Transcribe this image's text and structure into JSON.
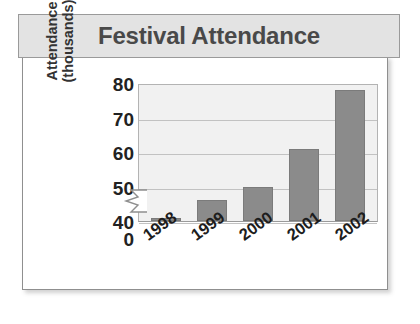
{
  "chart_data": {
    "type": "bar",
    "title": "Festival Attendance",
    "xlabel": "",
    "ylabel": "Attendance (thousands)",
    "ylabel_lines": [
      "Attendance",
      "(thousands)"
    ],
    "categories": [
      "1998",
      "1999",
      "2000",
      "2001",
      "2002"
    ],
    "values": [
      41,
      46,
      50,
      61,
      78
    ],
    "series": [
      {
        "name": "Attendance",
        "values": [
          41,
          46,
          50,
          61,
          78
        ]
      }
    ],
    "ytick_labels": [
      "80",
      "70",
      "60",
      "50",
      "40",
      "0"
    ],
    "ytick_values": [
      80,
      70,
      60,
      50,
      40,
      0
    ],
    "ylim": [
      40,
      80
    ],
    "axis_break": true,
    "axis_break_between": [
      0,
      40
    ],
    "grid": true,
    "grid_axis": "y",
    "legend": false,
    "legend_position": "none",
    "bar_color": "#8b8b8b",
    "plot_background": "#f1f1f1",
    "gridline_color": "#c2c2c2",
    "title_background": "#e3e3e3",
    "title_color": "#494949",
    "card_background": "#ffffff",
    "border_color": "#8f8f8f"
  }
}
